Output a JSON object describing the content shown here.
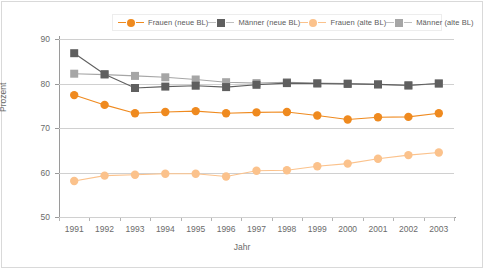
{
  "chart_data": {
    "type": "line",
    "title": "",
    "xlabel": "Jahr",
    "ylabel": "Prozent",
    "categories": [
      "1991",
      "1992",
      "1993",
      "1994",
      "1995",
      "1996",
      "1997",
      "1998",
      "1999",
      "2000",
      "2001",
      "2002",
      "2003"
    ],
    "x": [
      1991,
      1992,
      1993,
      1994,
      1995,
      1996,
      1997,
      1998,
      1999,
      2000,
      2001,
      2002,
      2003
    ],
    "ylim": [
      50,
      90
    ],
    "yticks": [
      50,
      60,
      70,
      80,
      90
    ],
    "grid": true,
    "legend_position": "top",
    "series": [
      {
        "name": "Frauen (neue BL)",
        "color": "#ef8a1f",
        "marker": "circle",
        "values": [
          77.4,
          75.2,
          73.3,
          73.6,
          73.8,
          73.3,
          73.5,
          73.6,
          72.8,
          71.9,
          72.4,
          72.5,
          73.3
        ]
      },
      {
        "name": "Männer (neue BL)",
        "color": "#5f5f5f",
        "marker": "square",
        "values": [
          86.8,
          82.1,
          79.0,
          79.3,
          79.5,
          79.2,
          79.7,
          80.1,
          80.0,
          79.9,
          79.8,
          79.6,
          80.0
        ]
      },
      {
        "name": "Frauen (alte BL)",
        "color": "#fbc28c",
        "marker": "circle",
        "values": [
          58.1,
          59.3,
          59.5,
          59.7,
          59.7,
          59.1,
          60.4,
          60.5,
          61.4,
          62.0,
          63.1,
          63.9,
          64.5
        ]
      },
      {
        "name": "Männer (alte BL)",
        "color": "#a6a6a6",
        "marker": "square",
        "values": [
          82.2,
          82.0,
          81.7,
          81.4,
          80.9,
          80.3,
          80.1,
          80.3,
          80.1,
          80.0,
          79.8,
          79.5,
          80.0
        ]
      }
    ]
  },
  "legend": {
    "items": [
      {
        "label": "Frauen (neue BL)",
        "icon": "dot-marker-icon",
        "color": "#ef8a1f"
      },
      {
        "label": "Männer (neue BL)",
        "icon": "square-marker-icon",
        "color": "#5f5f5f"
      },
      {
        "label": "Frauen (alte BL)",
        "icon": "dot-marker-icon",
        "color": "#fbc28c"
      },
      {
        "label": "Männer (alte BL)",
        "icon": "square-marker-icon",
        "color": "#a6a6a6"
      }
    ]
  },
  "axes": {
    "y_title": "Prozent",
    "x_title": "Jahr",
    "y_tick_labels": [
      "90",
      "80",
      "70",
      "60",
      "50"
    ],
    "x_tick_labels": [
      "1991",
      "1992",
      "1993",
      "1994",
      "1995",
      "1996",
      "1997",
      "1998",
      "1999",
      "2000",
      "2001",
      "2002",
      "2003"
    ]
  }
}
